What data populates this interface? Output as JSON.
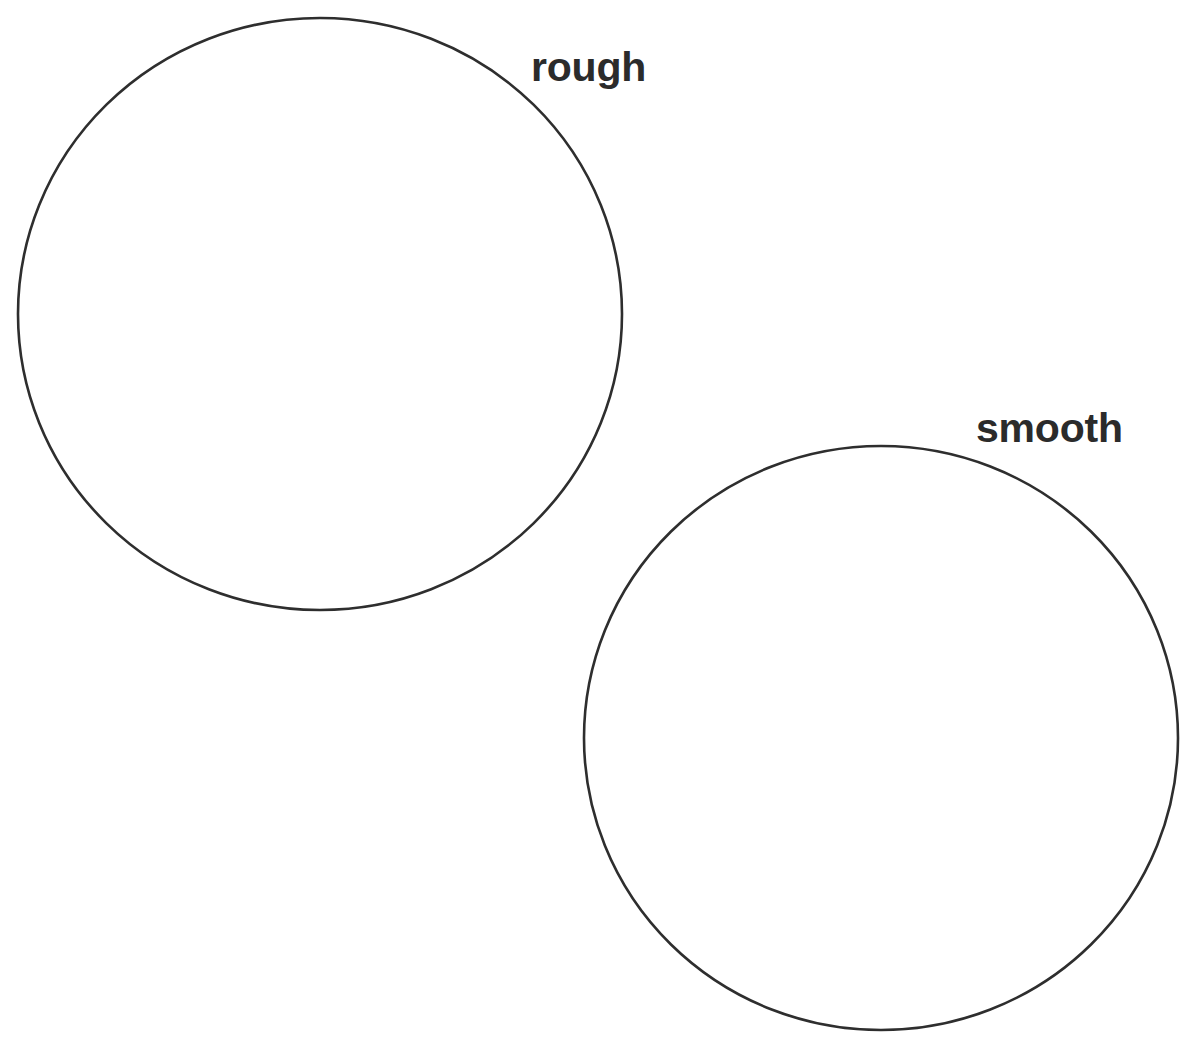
{
  "page": {
    "background_color": "#ffffff",
    "width": 1196,
    "height": 1041
  },
  "style": {
    "stroke_color": "#2e2e2e",
    "stroke_width": 2.6,
    "fill": "none",
    "text_color": "#2b2b2b",
    "font_size_px": 41,
    "font_weight": "bold"
  },
  "shapes": [
    {
      "id": "circle-rough",
      "type": "circle",
      "label": "rough",
      "center_x": 320,
      "center_y": 314,
      "radius_x": 302,
      "radius_y": 296,
      "stroke_color": "#2e2e2e",
      "fill": "none",
      "label_x": 531,
      "label_y": 47
    },
    {
      "id": "circle-smooth",
      "type": "circle",
      "label": "smooth",
      "center_x": 881,
      "center_y": 738,
      "radius_x": 297,
      "radius_y": 292,
      "stroke_color": "#2e2e2e",
      "fill": "none",
      "label_x": 976,
      "label_y": 408
    }
  ],
  "labels": {
    "rough": "rough",
    "smooth": "smooth"
  }
}
